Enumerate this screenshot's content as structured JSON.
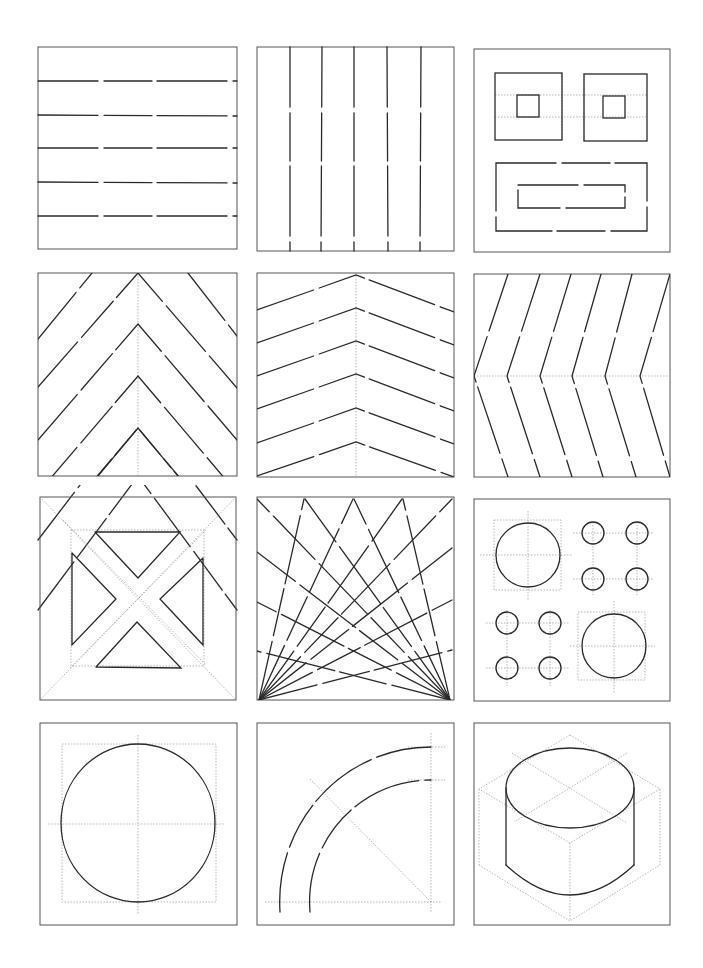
{
  "sheet": {
    "title": "",
    "background": "#ffffff",
    "ink_color": "#2a2a2a",
    "guide_color": "#9a9a9a",
    "layout": {
      "rows": 4,
      "cols": 3
    },
    "panels": [
      {
        "id": 1,
        "row": 1,
        "col": 1,
        "subject": "horizontal-parallel-lines",
        "line_count": 5
      },
      {
        "id": 2,
        "row": 1,
        "col": 2,
        "subject": "vertical-parallel-lines",
        "line_count": 5
      },
      {
        "id": 3,
        "row": 1,
        "col": 3,
        "subject": "nested-rectangles",
        "shapes": [
          "square-with-inner-square",
          "square-with-inner-square",
          "wide-rectangle-with-inner-rectangle"
        ]
      },
      {
        "id": 4,
        "row": 2,
        "col": 1,
        "subject": "vertical-chevrons-steep",
        "chevron_count": 4
      },
      {
        "id": 5,
        "row": 2,
        "col": 2,
        "subject": "vertical-chevrons-shallow",
        "chevron_count": 6
      },
      {
        "id": 6,
        "row": 2,
        "col": 3,
        "subject": "horizontal-chevrons",
        "chevron_count": 6
      },
      {
        "id": 7,
        "row": 3,
        "col": 1,
        "subject": "diagonal-cross-in-square"
      },
      {
        "id": 8,
        "row": 3,
        "col": 2,
        "subject": "radiating-lines-from-bottom-corners"
      },
      {
        "id": 9,
        "row": 3,
        "col": 3,
        "subject": "circles-with-centerlines",
        "large_circles": 2,
        "small_circles": 8
      },
      {
        "id": 10,
        "row": 4,
        "col": 1,
        "subject": "circle-in-square-with-centerlines"
      },
      {
        "id": 11,
        "row": 4,
        "col": 2,
        "subject": "quarter-arc-band"
      },
      {
        "id": 12,
        "row": 4,
        "col": 3,
        "subject": "isometric-cylinder-in-cube"
      }
    ]
  }
}
